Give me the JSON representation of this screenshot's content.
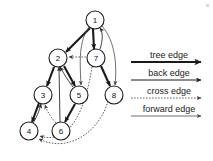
{
  "figure": {
    "background_color": "#ffffff",
    "ink_color": "#1a1a1a"
  },
  "graph": {
    "nodes": [
      {
        "id": "1",
        "label": "1",
        "cx": 95,
        "cy": 20,
        "r": 9
      },
      {
        "id": "2",
        "label": "2",
        "cx": 58,
        "cy": 58,
        "r": 9
      },
      {
        "id": "3",
        "label": "3",
        "cx": 43,
        "cy": 95,
        "r": 9
      },
      {
        "id": "4",
        "label": "4",
        "cx": 29,
        "cy": 131,
        "r": 9
      },
      {
        "id": "5",
        "label": "5",
        "cx": 79,
        "cy": 95,
        "r": 9
      },
      {
        "id": "6",
        "label": "6",
        "cx": 61,
        "cy": 131,
        "r": 9
      },
      {
        "id": "7",
        "label": "7",
        "cx": 96,
        "cy": 58,
        "r": 9
      },
      {
        "id": "8",
        "label": "8",
        "cx": 114,
        "cy": 95,
        "r": 9
      }
    ],
    "edges": [
      {
        "from": "1",
        "to": "2",
        "type": "tree",
        "path": "M 90 28 L 66 52"
      },
      {
        "from": "1",
        "to": "7",
        "type": "tree",
        "path": "M 93 29 L 94 49"
      },
      {
        "from": "2",
        "to": "3",
        "type": "tree",
        "path": "M 54 67 L 47 86"
      },
      {
        "from": "2",
        "to": "5",
        "type": "tree",
        "path": "M 64 66 L 75 86"
      },
      {
        "from": "3",
        "to": "4",
        "type": "tree",
        "path": "M 39 103 L 32 122"
      },
      {
        "from": "5",
        "to": "6",
        "type": "tree",
        "path": "M 75 104 L 65 122"
      },
      {
        "from": "7",
        "to": "8",
        "type": "tree",
        "path": "M 101 66 L 110 86"
      },
      {
        "from": "7",
        "to": "1",
        "type": "back",
        "path": "M 100 49 C 103 40 103 32 100 28"
      },
      {
        "from": "4",
        "to": "3",
        "type": "back",
        "path": "M 33 123 C 38 115 40 108 41 104"
      },
      {
        "from": "5",
        "to": "2",
        "type": "back",
        "path": "M 73 87 C 66 78 62 70 60 67"
      },
      {
        "from": "6",
        "to": "2",
        "type": "back",
        "path": "M 60 122 L 59 67"
      },
      {
        "from": "1",
        "to": "5",
        "type": "forward",
        "path": "M 90 26 C 78 40 80 64 81 85"
      },
      {
        "from": "1",
        "to": "8",
        "type": "forward",
        "path": "M 102 26 C 116 42 117 68 115 85"
      },
      {
        "from": "7",
        "to": "2",
        "type": "cross",
        "path": "M 86 57 L 69 57"
      },
      {
        "from": "6",
        "to": "3",
        "type": "cross",
        "path": "M 56 123 C 48 114 46 108 45 105"
      },
      {
        "from": "7",
        "to": "4",
        "type": "cross",
        "path": "M 92 67 C 86 105 72 146 40 136"
      },
      {
        "from": "8",
        "to": "4",
        "type": "cross",
        "path": "M 108 101 C 100 130 70 154 39 139"
      }
    ]
  },
  "legend": {
    "items": [
      {
        "key": "tree",
        "label": "tree edge",
        "style": "thick solid",
        "color": "#1a1a1a"
      },
      {
        "key": "back",
        "label": "back edge",
        "style": "thin solid",
        "color": "#1a1a1a"
      },
      {
        "key": "cross",
        "label": "cross edge",
        "style": "dashed",
        "color": "#3a3a3a"
      },
      {
        "key": "forward",
        "label": "forward edge",
        "style": "thin solid",
        "color": "#4a4a4a"
      }
    ]
  }
}
